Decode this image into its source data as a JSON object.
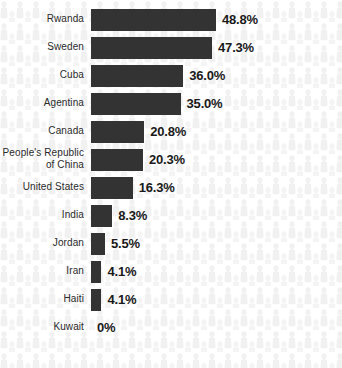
{
  "chart_data": {
    "type": "bar",
    "orientation": "horizontal",
    "title": "",
    "subtitle": "",
    "xlabel": "",
    "ylabel": "",
    "xlim": [
      0,
      50
    ],
    "grid": false,
    "legend": false,
    "value_suffix": "%",
    "categories": [
      "Rwanda",
      "Sweden",
      "Cuba",
      "Agentina",
      "Canada",
      "People's Republic\nof China",
      "United States",
      "India",
      "Jordan",
      "Iran",
      "Haiti",
      "Kuwait"
    ],
    "values": [
      48.8,
      47.3,
      36.0,
      35.0,
      20.8,
      20.3,
      16.3,
      8.3,
      5.5,
      4.1,
      4.1,
      0
    ],
    "value_labels": [
      "48.8%",
      "47.3%",
      "36.0%",
      "35.0%",
      "20.8%",
      "20.3%",
      "16.3%",
      "8.3%",
      "5.5%",
      "4.1%",
      "4.1%",
      "0%"
    ],
    "bar_color": "#333333",
    "label_color": "#2b2b2b",
    "value_color": "#1a1a1a",
    "background_color": "#ffffff",
    "background_motif": "person-silhouette-pattern",
    "background_motif_color": "#f0f0f0"
  },
  "layout": {
    "bar_origin_x": 91,
    "px_per_percent": 2.56,
    "row_pitch": 28,
    "first_row_top": 8,
    "bar_height": 22,
    "value_gap": 6
  }
}
